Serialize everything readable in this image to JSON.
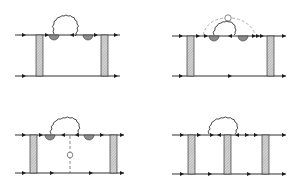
{
  "figure": {
    "colors": {
      "line": "#1a1a1a",
      "hatch_fill": "#c8c8c8",
      "dashed": "#9a9a9a",
      "blob": "#8c8c8c"
    },
    "panels": [
      {
        "id": "top-left",
        "boxes": 2,
        "wavy_loop": true,
        "vertex_blobs": 2,
        "dashed_arc": false,
        "dashed_vertical": false
      },
      {
        "id": "top-right",
        "boxes": 2,
        "wavy_loop": true,
        "vertex_blobs": 2,
        "dashed_arc": true,
        "dashed_vertical": false
      },
      {
        "id": "bottom-left",
        "boxes": 2,
        "wavy_loop": true,
        "vertex_blobs": 2,
        "dashed_arc": false,
        "dashed_vertical": true
      },
      {
        "id": "bottom-right",
        "boxes": 3,
        "wavy_loop": true,
        "vertex_blobs": 0,
        "dashed_arc": false,
        "dashed_vertical": false
      }
    ]
  }
}
